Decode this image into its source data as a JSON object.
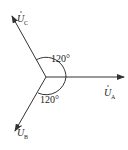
{
  "diagram": {
    "type": "phasor",
    "origin": [
      46,
      77
    ],
    "stroke_color": "#333333",
    "phasors": [
      {
        "id": "A",
        "symbol": "U",
        "subscript": "A",
        "angle_deg": 0
      },
      {
        "id": "B",
        "symbol": "U",
        "subscript": "B",
        "angle_deg": -120
      },
      {
        "id": "C",
        "symbol": "U",
        "subscript": "C",
        "angle_deg": 120
      }
    ],
    "angles": [
      {
        "label": "120°",
        "between": [
          "A",
          "C"
        ]
      },
      {
        "label": "120°",
        "between": [
          "A",
          "B"
        ]
      }
    ]
  }
}
